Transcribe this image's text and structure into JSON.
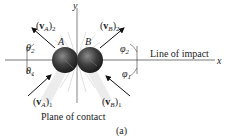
{
  "diagram": {
    "axes": {
      "x_label": "x",
      "y_label": "y"
    },
    "line_of_impact_label": "Line of impact",
    "plane_of_contact_label": "Plane of contact",
    "caption": "(a)",
    "spheres": [
      {
        "label": "A",
        "color": "#3a3a3a"
      },
      {
        "label": "B",
        "color": "#3a3a3a"
      }
    ],
    "vectors": {
      "vA2": {
        "v": "v",
        "sub_body": "A",
        "sub_state": "2"
      },
      "vB2": {
        "v": "v",
        "sub_body": "B",
        "sub_state": "2"
      },
      "vA1": {
        "v": "v",
        "sub_body": "A",
        "sub_state": "1"
      },
      "vB1": {
        "v": "v",
        "sub_body": "B",
        "sub_state": "1"
      }
    },
    "angles": {
      "theta2": {
        "sym": "θ",
        "sub": "2"
      },
      "theta1": {
        "sym": "θ",
        "sub": "1"
      },
      "phi2": {
        "sym": "φ",
        "sub": "2"
      },
      "phi1": {
        "sym": "φ",
        "sub": "1"
      }
    }
  }
}
